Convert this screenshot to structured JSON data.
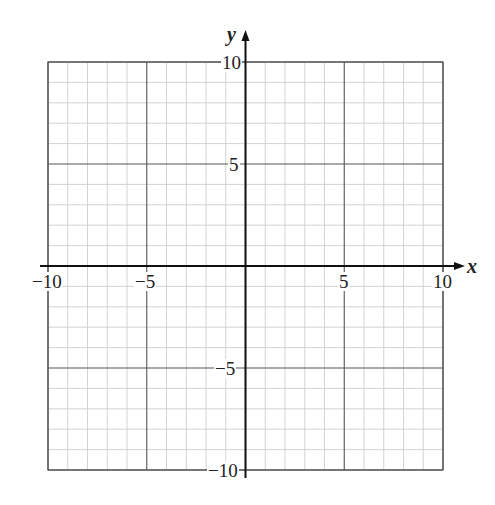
{
  "chart_data": {
    "type": "coordinate-grid",
    "title": "",
    "xlabel": "x",
    "ylabel": "y",
    "xlim": [
      -10,
      10
    ],
    "ylim": [
      -10,
      10
    ],
    "grid": true,
    "minor_step": 1,
    "major_step": 5,
    "x_tick_labels": [
      "-10",
      "-5",
      "5",
      "10"
    ],
    "y_tick_labels": [
      "10",
      "5",
      "-5",
      "-10"
    ],
    "series": []
  },
  "labels": {
    "x_axis": "x",
    "y_axis": "y",
    "x_neg10": "−10",
    "x_neg5": "−5",
    "x_5": "5",
    "x_10": "10",
    "y_10": "10",
    "y_5": "5",
    "y_neg5": "−5",
    "y_neg10": "−10"
  },
  "colors": {
    "minor_grid": "#c8c8c8",
    "major_grid": "#555555",
    "axis": "#111111",
    "background": "#ffffff"
  }
}
